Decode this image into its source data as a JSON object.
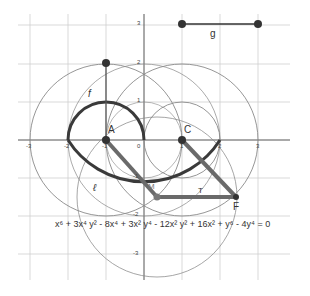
{
  "graph": {
    "origin_px": [
      144,
      140
    ],
    "unit_px": 38,
    "x_ticks": [
      {
        "label": "-3",
        "x": -3
      },
      {
        "label": "-2",
        "x": -2
      },
      {
        "label": "-1",
        "x": -1
      },
      {
        "label": "0",
        "x": 0
      },
      {
        "label": "1",
        "x": 1
      },
      {
        "label": "2",
        "x": 2
      },
      {
        "label": "3",
        "x": 3
      }
    ],
    "y_ticks": [
      {
        "label": "3",
        "y": 3
      },
      {
        "label": "2",
        "y": 2
      },
      {
        "label": "1",
        "y": 1
      },
      {
        "label": "-1",
        "y": -1
      },
      {
        "label": "-2",
        "y": -2
      },
      {
        "label": "-3",
        "y": -3
      }
    ],
    "points": {
      "A": {
        "label": "A",
        "x": -1,
        "y": 0
      },
      "C": {
        "label": "C",
        "x": 1,
        "y": 0
      },
      "M": {
        "label": "M",
        "x": 0.35,
        "y": -1.5
      },
      "F": {
        "label": "F",
        "x": 2.4,
        "y": -1.5
      },
      "P_top": {
        "label": "",
        "x": -1,
        "y": 2
      },
      "G1": {
        "label": "",
        "x": 1,
        "y": 3
      },
      "G2": {
        "label": "",
        "x": 3,
        "y": 3
      }
    },
    "object_labels": {
      "f": "f",
      "g": "g",
      "l": "ℓ",
      "t": "T"
    },
    "equation": "x⁶ + 3x⁴ y² - 8x⁴ + 3x² y⁴ - 12x² y² + 16x² + y⁶ - 4y⁴ = 0",
    "colors": {
      "grid": "#c8c8c8",
      "axis": "#555555",
      "thin_circle": "#8a8a8a",
      "thick_curve": "#3a3a3a",
      "thick_segment": "#6a6a6a",
      "point": "#333333"
    }
  }
}
